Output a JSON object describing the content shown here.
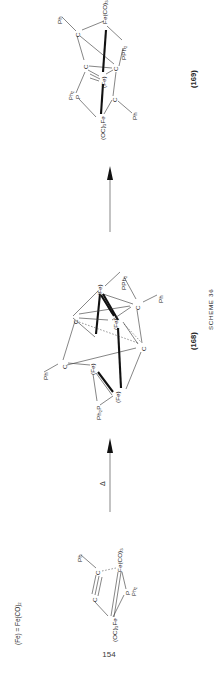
{
  "page": {
    "number": "154",
    "orientation": "rotated-90-ccw",
    "scheme_label": "SCHEME 36"
  },
  "legend": {
    "definition": "(Fe) = Fe(CO)₂"
  },
  "compounds": [
    {
      "id": "169",
      "label": "(169)"
    },
    {
      "id": "168",
      "label": "(168)"
    }
  ],
  "arrows": [
    {
      "name": "arrow-168-to-169",
      "condition": ""
    },
    {
      "name": "arrow-167-to-168",
      "condition": "Δ"
    }
  ],
  "structure_169": {
    "name": "compound-169-structure",
    "atoms": [
      {
        "key": "ph_top",
        "text": "Ph"
      },
      {
        "key": "c_topleft",
        "text": "C"
      },
      {
        "key": "fe_co",
        "text": "Fe(CO)₃"
      },
      {
        "key": "pph2",
        "text": "PPh₂"
      },
      {
        "key": "c_left",
        "text": "C"
      },
      {
        "key": "c_right",
        "text": "C"
      },
      {
        "key": "fe_mid",
        "text": "(Fe)"
      },
      {
        "key": "p_left",
        "text": "P"
      },
      {
        "key": "ph2_left",
        "text": "Ph₂"
      },
      {
        "key": "c_bottom",
        "text": "C"
      },
      {
        "key": "ph_bottom",
        "text": "Ph"
      },
      {
        "key": "fe_oc3",
        "text": "(OC)₃Fe"
      }
    ]
  },
  "structure_168": {
    "name": "compound-168-structure",
    "atoms": [
      {
        "key": "pph2",
        "text": "PPh₂"
      },
      {
        "key": "fe_upper",
        "text": "(Fe)"
      },
      {
        "key": "fe_mid",
        "text": "(Fe)"
      },
      {
        "key": "c_upright",
        "text": "C"
      },
      {
        "key": "ph_right",
        "text": "Ph"
      },
      {
        "key": "c_upleft",
        "text": "C"
      },
      {
        "key": "c_lowright",
        "text": "C"
      },
      {
        "key": "c_lowleft",
        "text": "C"
      },
      {
        "key": "ph_left",
        "text": "Ph"
      },
      {
        "key": "fe_left",
        "text": "(Fe)"
      },
      {
        "key": "fe_lower",
        "text": "(Fe)"
      },
      {
        "key": "ph2p",
        "text": "Ph₂P"
      }
    ]
  },
  "structure_167": {
    "name": "compound-167-structure",
    "atoms": [
      {
        "key": "ph",
        "text": "Ph"
      },
      {
        "key": "c_upper",
        "text": "C"
      },
      {
        "key": "c_lower",
        "text": "C"
      },
      {
        "key": "fe_co3",
        "text": "Fe(CO)₃"
      },
      {
        "key": "p",
        "text": "P"
      },
      {
        "key": "ph2",
        "text": "Ph₂"
      },
      {
        "key": "fe_oc3",
        "text": "(OC)₃Fe"
      }
    ]
  }
}
